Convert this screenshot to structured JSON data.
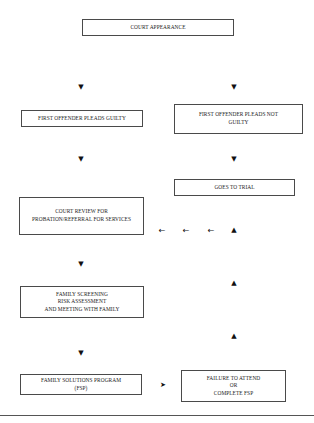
{
  "diagram": {
    "type": "flowchart",
    "nodes": {
      "court_appearance": "COURT APPEARANCE",
      "pleads_guilty": "FIRST OFFENDER PLEADS GUILTY",
      "pleads_not_guilty": "FIRST OFFENDER PLEADS NOT\nGUILTY",
      "goes_to_trial": "GOES TO TRIAL",
      "court_review": "COURT REVIEW FOR\nPROBATION/REFERRAL FOR SERVICES",
      "family_screening": "FAMILY SCREENING\nRISK ASSESSMENT\nAND MEETING WITH FAMILY",
      "fsp": "FAMILY SOLUTIONS PROGRAM\n(FSP)",
      "failure": "FAILURE TO ATTEND\nOR\nCOMPLETE FSP"
    },
    "edges": [
      {
        "from": "court_appearance",
        "to": "pleads_guilty"
      },
      {
        "from": "court_appearance",
        "to": "pleads_not_guilty"
      },
      {
        "from": "pleads_guilty",
        "to": "court_review"
      },
      {
        "from": "pleads_not_guilty",
        "to": "goes_to_trial"
      },
      {
        "from": "goes_to_trial",
        "to": "court_review"
      },
      {
        "from": "court_review",
        "to": "family_screening"
      },
      {
        "from": "family_screening",
        "to": "fsp"
      },
      {
        "from": "fsp",
        "to": "failure"
      },
      {
        "from": "failure",
        "to": "court_review"
      }
    ],
    "arrow_glyphs": {
      "down": "▼",
      "up": "▲",
      "left": "←",
      "right": "➤"
    }
  }
}
